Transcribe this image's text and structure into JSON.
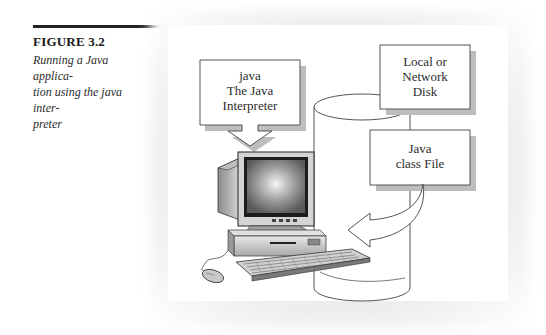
{
  "figure": {
    "number": "FIGURE 3.2",
    "caption": "Running a Java application using the java interpreter",
    "caption_lines": [
      "Running a Java applica-",
      "tion using the java inter-",
      "preter"
    ]
  },
  "diagram": {
    "interpreter_box": {
      "lines": [
        "java",
        "The Java",
        "Interpreter"
      ]
    },
    "disk_box": {
      "lines": [
        "Local or",
        "Network",
        "Disk"
      ]
    },
    "class_file_box": {
      "lines": [
        "Java",
        "class File"
      ]
    },
    "icons": {
      "computer": "desktop-computer-icon",
      "disk": "cylinder-disk-icon",
      "arrow_down": "arrow-down-icon",
      "arrow_curved": "curved-arrow-icon",
      "mouse": "mouse-icon",
      "keyboard": "keyboard-icon"
    },
    "colors": {
      "box_fill": "#ffffff",
      "box_border": "#555555",
      "box_shadow": "#b8b8b8",
      "text": "#2b2b2b"
    }
  }
}
